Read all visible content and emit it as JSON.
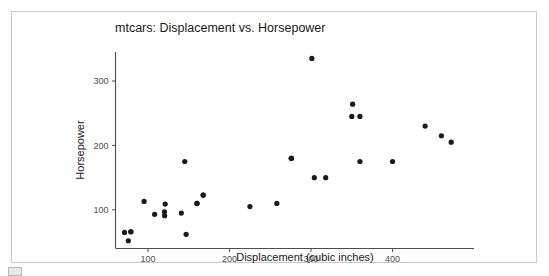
{
  "figure": {
    "title": "mtcars: Displacement vs. Horsepower",
    "frame_border_color": "#c9c9c9",
    "background_color": "#ffffff"
  },
  "bottom_chrome": {
    "label": ""
  },
  "chart_data": {
    "type": "scatter",
    "title": "mtcars: Displacement vs. Horsepower",
    "xlabel": "Displacement (cubic inches)",
    "ylabel": "Horsepower",
    "xlim": [
      60,
      500
    ],
    "ylim": [
      40,
      345
    ],
    "xticks": [
      100,
      200,
      300,
      400
    ],
    "yticks": [
      100,
      200,
      300
    ],
    "xtick_labels": [
      "100",
      "200",
      "300",
      "400"
    ],
    "ytick_labels": [
      "100",
      "200",
      "300"
    ],
    "grid": false,
    "legend": false,
    "point_color": "#1a1a1a",
    "point_size": 2.6,
    "x": [
      160,
      160,
      108,
      258,
      360,
      225,
      360,
      146.7,
      140.8,
      167.6,
      167.6,
      275.8,
      275.8,
      275.8,
      472,
      460,
      440,
      78.7,
      75.7,
      71.1,
      120.1,
      318,
      304,
      350,
      400,
      79,
      120.3,
      95.1,
      351,
      145,
      301,
      121
    ],
    "y": [
      110,
      110,
      93,
      110,
      175,
      105,
      245,
      62,
      95,
      123,
      123,
      180,
      180,
      180,
      205,
      215,
      230,
      66,
      52,
      65,
      97,
      150,
      150,
      245,
      175,
      66,
      91,
      113,
      264,
      175,
      335,
      109
    ],
    "series": [
      {
        "name": "mtcars",
        "points": [
          {
            "x": 71.1,
            "y": 65
          },
          {
            "x": 75.7,
            "y": 52
          },
          {
            "x": 78.7,
            "y": 66
          },
          {
            "x": 79.0,
            "y": 66
          },
          {
            "x": 95.1,
            "y": 113
          },
          {
            "x": 108.0,
            "y": 93
          },
          {
            "x": 120.1,
            "y": 97
          },
          {
            "x": 120.3,
            "y": 91
          },
          {
            "x": 121.0,
            "y": 109
          },
          {
            "x": 140.8,
            "y": 95
          },
          {
            "x": 145.0,
            "y": 175
          },
          {
            "x": 146.7,
            "y": 62
          },
          {
            "x": 160.0,
            "y": 110
          },
          {
            "x": 160.0,
            "y": 110
          },
          {
            "x": 167.6,
            "y": 123
          },
          {
            "x": 167.6,
            "y": 123
          },
          {
            "x": 225.0,
            "y": 105
          },
          {
            "x": 258.0,
            "y": 110
          },
          {
            "x": 275.8,
            "y": 180
          },
          {
            "x": 275.8,
            "y": 180
          },
          {
            "x": 275.8,
            "y": 180
          },
          {
            "x": 301.0,
            "y": 335
          },
          {
            "x": 304.0,
            "y": 150
          },
          {
            "x": 318.0,
            "y": 150
          },
          {
            "x": 350.0,
            "y": 245
          },
          {
            "x": 351.0,
            "y": 264
          },
          {
            "x": 360.0,
            "y": 175
          },
          {
            "x": 360.0,
            "y": 245
          },
          {
            "x": 400.0,
            "y": 175
          },
          {
            "x": 440.0,
            "y": 230
          },
          {
            "x": 460.0,
            "y": 215
          },
          {
            "x": 472.0,
            "y": 205
          }
        ]
      }
    ]
  }
}
